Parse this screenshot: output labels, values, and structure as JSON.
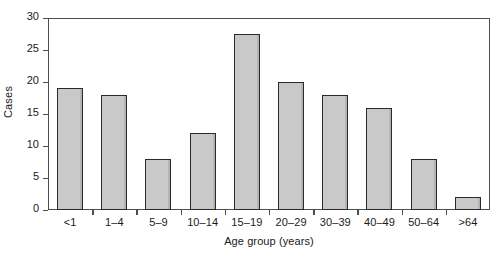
{
  "chart_data": {
    "type": "bar",
    "title": "",
    "xlabel": "Age group (years)",
    "ylabel": "Cases",
    "categories": [
      "<1",
      "1–4",
      "5–9",
      "10–14",
      "15–19",
      "20–29",
      "30–39",
      "40–49",
      "50–64",
      ">64"
    ],
    "values": [
      19,
      18,
      8,
      12,
      27.5,
      20,
      18,
      16,
      8,
      2
    ],
    "ylim": [
      0,
      30
    ],
    "yticks": [
      0,
      5,
      10,
      15,
      20,
      25,
      30
    ],
    "ytick_labels": [
      "0",
      "5",
      "10",
      "15",
      "20",
      "25",
      "30"
    ],
    "grid": false,
    "legend": null,
    "bar_fill_color": "#c9c9c9",
    "bar_edge_color": "#2b2b2b",
    "axis_color": "#4d4d4d",
    "background_color": "#ffffff"
  }
}
